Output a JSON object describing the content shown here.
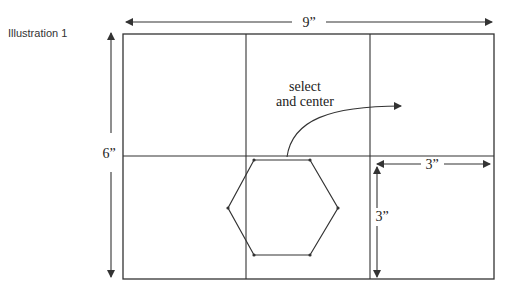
{
  "illustration": {
    "caption": "Illustration 1",
    "dimensions": {
      "width_label": "9”",
      "height_label": "6”",
      "cell_width_label": "3”",
      "cell_height_label": "3”"
    },
    "annotation": {
      "line1": "select",
      "line2": "and center"
    },
    "grid": {
      "columns": 3,
      "rows": 2
    },
    "shape": "hexagon",
    "colors": {
      "stroke": "#333333",
      "background": "#ffffff"
    }
  }
}
